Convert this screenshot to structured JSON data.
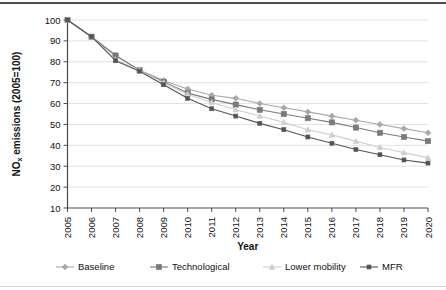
{
  "chart_data": {
    "type": "line",
    "title": "",
    "xlabel": "Year",
    "ylabel": "NOx emissions (2005=100)",
    "ylabel_main": "NO",
    "ylabel_sub": "x",
    "ylabel_rest": " emissions (2005=100)",
    "xlim": [
      2005,
      2020
    ],
    "ylim": [
      10,
      100
    ],
    "yticks": [
      10,
      20,
      30,
      40,
      50,
      60,
      70,
      80,
      90,
      100
    ],
    "grid": "horizontal",
    "legend_position": "bottom",
    "categories": [
      "2005",
      "2006",
      "2007",
      "2008",
      "2009",
      "2010",
      "2011",
      "2012",
      "2013",
      "2014",
      "2015",
      "2016",
      "2017",
      "2018",
      "2019",
      "2020"
    ],
    "x": [
      2005,
      2006,
      2007,
      2008,
      2009,
      2010,
      2011,
      2012,
      2013,
      2014,
      2015,
      2016,
      2017,
      2018,
      2019,
      2020
    ],
    "series": [
      {
        "name": "Baseline",
        "color": "#a9a9a9",
        "marker": "diamond",
        "values": [
          100,
          92,
          83,
          76,
          71,
          67,
          64,
          62.5,
          60,
          58,
          56,
          54,
          52,
          50,
          48,
          46
        ]
      },
      {
        "name": "Technological",
        "color": "#7a7a7a",
        "marker": "square",
        "values": [
          100,
          92,
          83,
          76,
          70.5,
          65,
          62,
          59.5,
          57,
          55,
          53,
          51,
          48.5,
          46,
          44,
          42
        ]
      },
      {
        "name": "Lower mobility",
        "color": "#cfcfcf",
        "marker": "triangle",
        "values": [
          100,
          92,
          81,
          76,
          70,
          64.5,
          60.5,
          57,
          54,
          51,
          47.5,
          45,
          42,
          39,
          36.5,
          34
        ]
      },
      {
        "name": "MFR",
        "color": "#555555",
        "marker": "cross",
        "values": [
          100,
          92,
          80.5,
          75.5,
          69,
          62.5,
          57.5,
          54,
          50.5,
          47.5,
          44,
          41,
          38,
          35.5,
          33,
          31.5
        ]
      }
    ]
  },
  "legend": {
    "items": [
      {
        "label": "Baseline"
      },
      {
        "label": "Technological"
      },
      {
        "label": "Lower mobility"
      },
      {
        "label": "MFR"
      }
    ]
  },
  "axis": {
    "x_title": "Year",
    "y_title_main": "NO",
    "y_title_sub": "x",
    "y_title_rest": " emissions (2005=100)"
  }
}
